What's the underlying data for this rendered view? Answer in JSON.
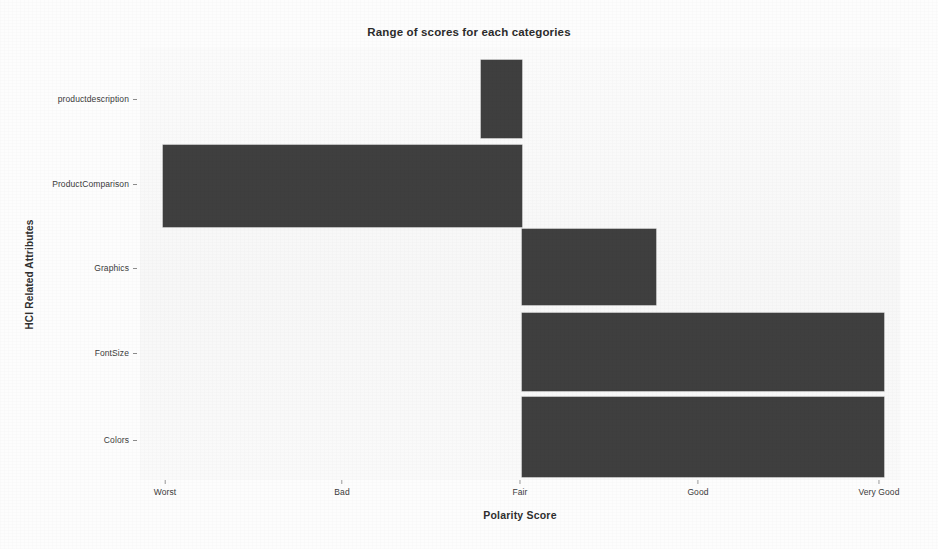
{
  "chart_data": {
    "type": "bar",
    "orientation": "horizontal",
    "title": "Range of scores for each categories",
    "xlabel": "Polarity Score",
    "ylabel": "HCI Related Attributes",
    "grid": false,
    "legend": null,
    "bar_color": "#3f3f3f",
    "background_color": "#fafafa",
    "x_tick_labels": [
      "Worst",
      "Bad",
      "Fair",
      "Good",
      "Very Good"
    ],
    "x_tick_values": [
      0,
      1,
      2,
      3,
      4
    ],
    "xlim": [
      -0.02,
      4.03
    ],
    "categories": [
      "productdescription",
      "ProductComparison",
      "Graphics",
      "FontSize",
      "Colors"
    ],
    "ranges": [
      {
        "category": "productdescription",
        "start": 1.77,
        "end": 2.0,
        "span": 0.23
      },
      {
        "category": "ProductComparison",
        "start": -0.01,
        "end": 2.0,
        "span": 2.01
      },
      {
        "category": "Graphics",
        "start": 2.0,
        "end": 2.75,
        "span": 0.75
      },
      {
        "category": "FontSize",
        "start": 2.0,
        "end": 4.03,
        "span": 2.03
      },
      {
        "category": "Colors",
        "start": 2.0,
        "end": 4.03,
        "span": 2.03
      }
    ]
  },
  "chart": {
    "title": "Range of scores for each categories",
    "x_axis_title": "Polarity Score",
    "y_axis_title": "HCI Related Attributes",
    "x_ticks": [
      {
        "label": "Worst"
      },
      {
        "label": "Bad"
      },
      {
        "label": "Fair"
      },
      {
        "label": "Good"
      },
      {
        "label": "Very Good"
      }
    ],
    "y_ticks": [
      {
        "label": "productdescription"
      },
      {
        "label": "ProductComparison"
      },
      {
        "label": "Graphics"
      },
      {
        "label": "FontSize"
      },
      {
        "label": "Colors"
      }
    ]
  }
}
